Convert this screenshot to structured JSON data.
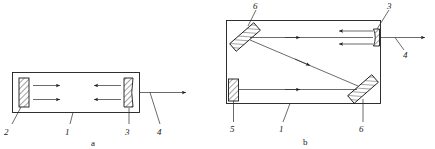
{
  "figure": {
    "caption_a": "a",
    "caption_b": "b",
    "panel_a": {
      "name": "linear-resonator",
      "labels": {
        "mirror_rear": "2",
        "active_medium": "1",
        "mirror_output": "3",
        "output_beam": "4"
      },
      "components": [
        {
          "id": "2",
          "type": "rear-mirror",
          "hatched": true
        },
        {
          "id": "1",
          "type": "active-medium-cavity",
          "hatched": false
        },
        {
          "id": "3",
          "type": "output-coupler-mirror",
          "hatched": true,
          "curved": true
        },
        {
          "id": "4",
          "type": "output-beam-arrow",
          "hatched": false
        }
      ],
      "beams": [
        {
          "direction": "right",
          "count": 2
        },
        {
          "direction": "left",
          "count": 2
        },
        {
          "direction": "right",
          "count": 1,
          "role": "output"
        }
      ]
    },
    "panel_b": {
      "name": "folded-ring-resonator",
      "labels": {
        "fold_mirror_top": "6",
        "output_coupler": "3",
        "output_beam": "4",
        "cavity_body": "1",
        "rear_mirror": "5",
        "fold_mirror_bottom": "6"
      },
      "components": [
        {
          "id": "6",
          "type": "fold-mirror-45deg",
          "position": "top-left",
          "hatched": true
        },
        {
          "id": "3",
          "type": "output-coupler",
          "position": "top-right",
          "hatched": true
        },
        {
          "id": "4",
          "type": "output-beam-arrow"
        },
        {
          "id": "1",
          "type": "cavity-body"
        },
        {
          "id": "5",
          "type": "rear-mirror",
          "position": "bottom-left",
          "hatched": true
        },
        {
          "id": "6",
          "type": "fold-mirror-45deg",
          "position": "bottom-right",
          "hatched": true
        }
      ],
      "beams": [
        {
          "direction": "right",
          "path": "top-horizontal",
          "count": 1
        },
        {
          "direction": "left",
          "path": "top-horizontal-return",
          "count": 2
        },
        {
          "direction": "down-right",
          "path": "diagonal-fold",
          "count": 1
        },
        {
          "direction": "right",
          "path": "bottom-horizontal",
          "count": 1
        },
        {
          "direction": "right",
          "path": "output",
          "count": 1
        }
      ]
    },
    "colors": {
      "ink": "#1a1a1a",
      "background": "#ffffff"
    }
  }
}
